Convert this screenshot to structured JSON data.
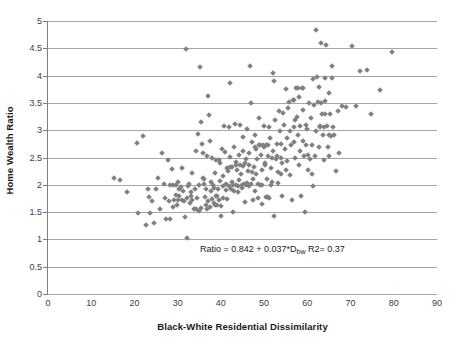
{
  "chart_data": {
    "type": "scatter",
    "title": "",
    "xlabel": "Black-White Residential Dissimilarity",
    "ylabel": "Home Wealth Ratio",
    "xlim": [
      0,
      90
    ],
    "ylim": [
      0,
      5
    ],
    "xticks": [
      0,
      10,
      20,
      30,
      40,
      50,
      60,
      70,
      80,
      90
    ],
    "yticks": [
      0,
      0.5,
      1,
      1.5,
      2,
      2.5,
      3,
      3.5,
      4,
      4.5,
      5
    ],
    "grid": "horizontal",
    "legend": "none",
    "marker": {
      "shape": "diamond",
      "color": "#808080",
      "size": 4
    },
    "annotations": [
      {
        "text_prefix": "Ratio = 0.842 + 0.037*D",
        "text_sub": "bw",
        "text_suffix": " R2= 0.37",
        "x": 50,
        "y": 0.85
      }
    ],
    "fit": {
      "intercept": 0.842,
      "slope": 0.037,
      "r_squared": 0.37
    },
    "n_points": 300,
    "points": [
      [
        15.2,
        2.13
      ],
      [
        16.6,
        2.08
      ],
      [
        18.3,
        1.87
      ],
      [
        20.6,
        2.77
      ],
      [
        20.9,
        1.48
      ],
      [
        22.0,
        2.89
      ],
      [
        22.7,
        1.27
      ],
      [
        23.2,
        1.92
      ],
      [
        23.4,
        1.78
      ],
      [
        23.6,
        1.48
      ],
      [
        24.1,
        1.7
      ],
      [
        24.6,
        1.3
      ],
      [
        24.9,
        1.92
      ],
      [
        25.4,
        2.12
      ],
      [
        26.0,
        1.55
      ],
      [
        26.4,
        2.58
      ],
      [
        26.8,
        2.01
      ],
      [
        27.1,
        1.75
      ],
      [
        27.4,
        1.38
      ],
      [
        27.8,
        2.46
      ],
      [
        28.0,
        1.71
      ],
      [
        28.3,
        1.38
      ],
      [
        28.6,
        2.29
      ],
      [
        28.9,
        1.99
      ],
      [
        29.2,
        1.72
      ],
      [
        29.5,
        1.82
      ],
      [
        29.8,
        1.63
      ],
      [
        30.1,
        2.05
      ],
      [
        30.4,
        1.79
      ],
      [
        30.7,
        1.96
      ],
      [
        31.0,
        2.3
      ],
      [
        31.3,
        1.88
      ],
      [
        31.5,
        1.7
      ],
      [
        31.8,
        1.41
      ],
      [
        32.0,
        4.49
      ],
      [
        32.1,
        1.03
      ],
      [
        32.3,
        1.97
      ],
      [
        32.6,
        2.02
      ],
      [
        32.9,
        1.67
      ],
      [
        33.2,
        1.8
      ],
      [
        33.4,
        2.21
      ],
      [
        33.7,
        1.56
      ],
      [
        34.0,
        1.92
      ],
      [
        34.3,
        2.61
      ],
      [
        34.6,
        2.93
      ],
      [
        34.9,
        1.52
      ],
      [
        35.1,
        4.15
      ],
      [
        35.4,
        3.15
      ],
      [
        35.6,
        2.74
      ],
      [
        35.9,
        2.12
      ],
      [
        36.1,
        2.02
      ],
      [
        36.3,
        1.78
      ],
      [
        36.6,
        1.63
      ],
      [
        36.8,
        1.55
      ],
      [
        37.0,
        3.63
      ],
      [
        37.2,
        3.28
      ],
      [
        37.4,
        2.8
      ],
      [
        37.6,
        2.05
      ],
      [
        37.8,
        1.88
      ],
      [
        38.0,
        1.74
      ],
      [
        38.3,
        1.66
      ],
      [
        38.5,
        1.95
      ],
      [
        38.7,
        2.22
      ],
      [
        38.9,
        1.79
      ],
      [
        39.1,
        1.63
      ],
      [
        39.3,
        1.92
      ],
      [
        39.5,
        2.45
      ],
      [
        39.8,
        2.07
      ],
      [
        40.0,
        1.42
      ],
      [
        40.2,
        2.66
      ],
      [
        40.4,
        1.98
      ],
      [
        40.6,
        2.17
      ],
      [
        40.8,
        3.07
      ],
      [
        41.0,
        2.6
      ],
      [
        41.2,
        1.9
      ],
      [
        41.4,
        1.74
      ],
      [
        41.6,
        2.25
      ],
      [
        41.8,
        3.05
      ],
      [
        42.0,
        3.86
      ],
      [
        42.2,
        2.33
      ],
      [
        42.4,
        1.93
      ],
      [
        42.6,
        2.05
      ],
      [
        42.8,
        1.51
      ],
      [
        43.0,
        2.7
      ],
      [
        43.2,
        3.12
      ],
      [
        43.4,
        2.41
      ],
      [
        43.6,
        1.99
      ],
      [
        43.8,
        2.28
      ],
      [
        44.0,
        1.86
      ],
      [
        44.2,
        2.54
      ],
      [
        44.4,
        3.09
      ],
      [
        44.6,
        2.2
      ],
      [
        44.8,
        1.95
      ],
      [
        45.0,
        2.88
      ],
      [
        45.2,
        2.35
      ],
      [
        45.4,
        2.02
      ],
      [
        45.6,
        1.69
      ],
      [
        45.8,
        2.48
      ],
      [
        46.0,
        3.02
      ],
      [
        46.2,
        2.26
      ],
      [
        46.4,
        1.97
      ],
      [
        46.6,
        2.58
      ],
      [
        46.8,
        4.18
      ],
      [
        47.0,
        3.5
      ],
      [
        47.2,
        2.78
      ],
      [
        47.4,
        2.1
      ],
      [
        47.6,
        2.33
      ],
      [
        47.8,
        1.88
      ],
      [
        48.0,
        2.91
      ],
      [
        48.2,
        2.66
      ],
      [
        48.4,
        2.47
      ],
      [
        48.6,
        2.02
      ],
      [
        48.8,
        3.22
      ],
      [
        49.0,
        2.72
      ],
      [
        49.2,
        2.55
      ],
      [
        49.4,
        2.28
      ],
      [
        49.6,
        1.99
      ],
      [
        49.8,
        2.73
      ],
      [
        50.0,
        3.08
      ],
      [
        50.2,
        2.4
      ],
      [
        50.4,
        2.72
      ],
      [
        50.6,
        2.1
      ],
      [
        50.8,
        1.77
      ],
      [
        51.0,
        2.52
      ],
      [
        51.2,
        3.05
      ],
      [
        51.4,
        2.86
      ],
      [
        51.6,
        2.31
      ],
      [
        51.8,
        2.06
      ],
      [
        52.0,
        4.05
      ],
      [
        52.2,
        1.43
      ],
      [
        52.4,
        3.9
      ],
      [
        52.6,
        3.18
      ],
      [
        52.8,
        2.48
      ],
      [
        53.0,
        2.75
      ],
      [
        53.2,
        2.23
      ],
      [
        53.4,
        3.36
      ],
      [
        53.6,
        2.98
      ],
      [
        53.8,
        2.5
      ],
      [
        54.0,
        2.2
      ],
      [
        54.2,
        1.79
      ],
      [
        54.4,
        3.32
      ],
      [
        54.6,
        3.1
      ],
      [
        54.8,
        2.66
      ],
      [
        55.0,
        3.76
      ],
      [
        55.2,
        2.86
      ],
      [
        55.4,
        2.44
      ],
      [
        55.6,
        3.41
      ],
      [
        55.8,
        3.52
      ],
      [
        56.0,
        2.18
      ],
      [
        56.2,
        2.72
      ],
      [
        56.4,
        1.72
      ],
      [
        56.6,
        3.55
      ],
      [
        56.8,
        3.06
      ],
      [
        57.0,
        2.79
      ],
      [
        57.2,
        2.5
      ],
      [
        57.4,
        3.78
      ],
      [
        57.6,
        3.25
      ],
      [
        57.8,
        2.92
      ],
      [
        58.0,
        3.6
      ],
      [
        58.2,
        3.07
      ],
      [
        58.4,
        2.62
      ],
      [
        58.6,
        1.8
      ],
      [
        58.8,
        3.77
      ],
      [
        59.0,
        3.37
      ],
      [
        59.2,
        2.53
      ],
      [
        59.4,
        1.51
      ],
      [
        59.6,
        3.1
      ],
      [
        59.8,
        2.72
      ],
      [
        60.0,
        3.02
      ],
      [
        60.2,
        2.28
      ],
      [
        60.4,
        3.49
      ],
      [
        60.6,
        2.47
      ],
      [
        60.8,
        3.22
      ],
      [
        61.0,
        2.73
      ],
      [
        61.2,
        1.97
      ],
      [
        61.4,
        3.93
      ],
      [
        61.6,
        3.46
      ],
      [
        61.8,
        2.52
      ],
      [
        62.0,
        4.83
      ],
      [
        62.2,
        3.98
      ],
      [
        62.4,
        3.52
      ],
      [
        62.6,
        2.69
      ],
      [
        62.8,
        3.8
      ],
      [
        63.0,
        3.06
      ],
      [
        63.2,
        4.6
      ],
      [
        63.4,
        3.3
      ],
      [
        63.6,
        2.92
      ],
      [
        63.8,
        2.45
      ],
      [
        64.0,
        3.95
      ],
      [
        64.2,
        3.54
      ],
      [
        64.4,
        4.56
      ],
      [
        64.6,
        3.08
      ],
      [
        64.8,
        2.7
      ],
      [
        65.0,
        3.68
      ],
      [
        65.2,
        3.3
      ],
      [
        65.4,
        2.9
      ],
      [
        65.8,
        4.17
      ],
      [
        66.2,
        2.92
      ],
      [
        66.6,
        2.25
      ],
      [
        67.0,
        3.35
      ],
      [
        67.4,
        2.58
      ],
      [
        68.0,
        3.44
      ],
      [
        69.0,
        3.42
      ],
      [
        70.4,
        4.54
      ],
      [
        71.2,
        3.44
      ],
      [
        72.2,
        4.09
      ],
      [
        73.8,
        4.11
      ],
      [
        74.8,
        3.29
      ],
      [
        76.8,
        3.73
      ],
      [
        79.6,
        4.43
      ],
      [
        29.6,
        2.0
      ],
      [
        30.2,
        1.93
      ],
      [
        33.0,
        1.86
      ],
      [
        34.2,
        1.55
      ],
      [
        35.0,
        1.99
      ],
      [
        36.0,
        2.1
      ],
      [
        37.1,
        1.7
      ],
      [
        38.2,
        2.0
      ],
      [
        39.0,
        1.79
      ],
      [
        40.1,
        1.61
      ],
      [
        41.1,
        2.02
      ],
      [
        42.1,
        2.51
      ],
      [
        43.1,
        1.88
      ],
      [
        44.1,
        2.08
      ],
      [
        45.1,
        2.62
      ],
      [
        46.1,
        2.04
      ],
      [
        47.1,
        2.24
      ],
      [
        48.1,
        2.19
      ],
      [
        49.1,
        2.0
      ],
      [
        50.1,
        2.36
      ],
      [
        51.1,
        1.75
      ],
      [
        52.1,
        2.62
      ],
      [
        53.1,
        2.04
      ],
      [
        54.1,
        2.4
      ],
      [
        55.1,
        2.28
      ],
      [
        56.1,
        2.98
      ],
      [
        57.1,
        3.18
      ],
      [
        58.1,
        2.36
      ],
      [
        59.1,
        2.8
      ],
      [
        60.1,
        2.55
      ],
      [
        61.1,
        2.2
      ],
      [
        62.1,
        2.98
      ],
      [
        63.1,
        3.5
      ],
      [
        64.1,
        3.3
      ],
      [
        65.1,
        2.52
      ],
      [
        28.2,
        2.0
      ],
      [
        29.0,
        1.6
      ],
      [
        30.0,
        1.72
      ],
      [
        31.1,
        1.72
      ],
      [
        32.2,
        1.75
      ],
      [
        33.3,
        1.72
      ],
      [
        34.4,
        1.75
      ],
      [
        35.5,
        1.58
      ],
      [
        36.5,
        1.92
      ],
      [
        37.5,
        1.6
      ],
      [
        38.6,
        1.63
      ],
      [
        39.6,
        1.73
      ],
      [
        40.5,
        1.75
      ],
      [
        41.5,
        2.3
      ],
      [
        42.5,
        2.32
      ],
      [
        43.5,
        2.36
      ],
      [
        44.5,
        2.36
      ],
      [
        45.5,
        2.4
      ],
      [
        46.5,
        2.37
      ],
      [
        47.5,
        1.73
      ],
      [
        48.5,
        1.75
      ],
      [
        49.5,
        1.65
      ],
      [
        50.5,
        1.78
      ],
      [
        51.5,
        2.0
      ],
      [
        44.9,
        2.0
      ],
      [
        45.9,
        1.99
      ],
      [
        46.9,
        2.02
      ],
      [
        43.9,
        1.98
      ],
      [
        42.9,
        2.0
      ],
      [
        41.9,
        1.97
      ],
      [
        49.9,
        2.7
      ],
      [
        48.9,
        2.73
      ],
      [
        47.9,
        2.7
      ],
      [
        50.9,
        2.72
      ],
      [
        51.9,
        2.5
      ],
      [
        52.9,
        2.52
      ],
      [
        53.9,
        2.75
      ],
      [
        38.8,
        2.45
      ],
      [
        39.9,
        2.4
      ],
      [
        37.9,
        2.5
      ],
      [
        36.9,
        2.52
      ],
      [
        35.8,
        2.58
      ],
      [
        62.9,
        3.08
      ],
      [
        63.9,
        3.06
      ],
      [
        64.9,
        2.92
      ],
      [
        65.6,
        3.96
      ],
      [
        66.0,
        3.05
      ],
      [
        58.9,
        3.78
      ],
      [
        57.9,
        3.77
      ],
      [
        56.9,
        3.55
      ]
    ]
  },
  "axis": {
    "y_tick_labels": [
      "5",
      "4.5",
      "4",
      "3.5",
      "3",
      "2.5",
      "2",
      "1.5",
      "1",
      "0.5",
      "0"
    ],
    "x_tick_labels": [
      "0",
      "10",
      "20",
      "30",
      "40",
      "50",
      "60",
      "70",
      "80",
      "90"
    ]
  }
}
